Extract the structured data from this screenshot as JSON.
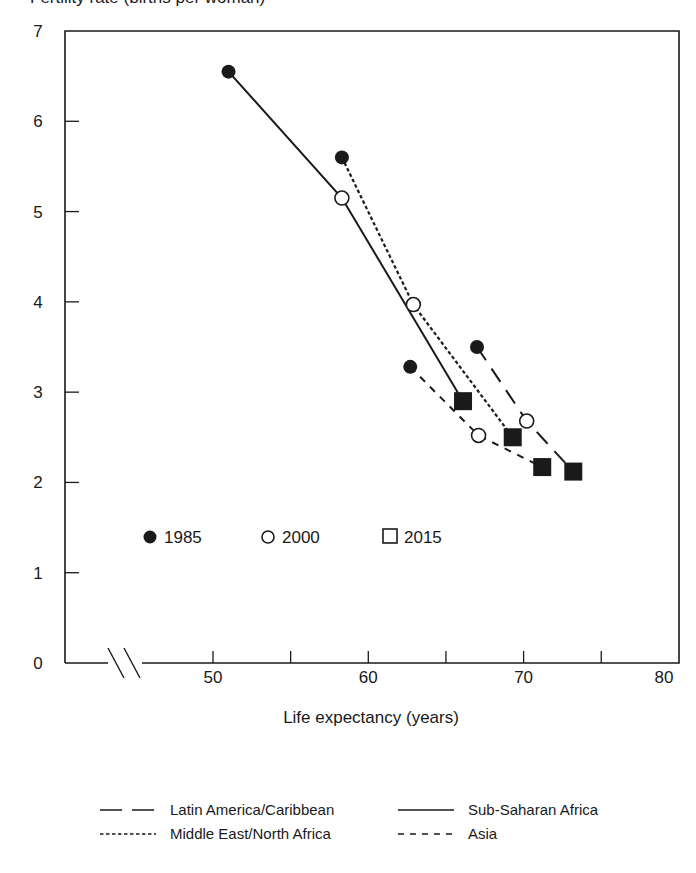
{
  "title_cutoff": "Fertility rate (births per woman)",
  "chart_data": {
    "type": "line",
    "title": "",
    "xlabel": "Life expectancy (years)",
    "ylabel": "",
    "xlim": [
      42,
      80
    ],
    "ylim": [
      0,
      7
    ],
    "x_ticks": [
      50,
      55,
      60,
      65,
      70,
      75,
      80
    ],
    "x_tick_labels": [
      "50",
      "60",
      "70",
      "80"
    ],
    "x_labeled_ticks": [
      50,
      60,
      70,
      80
    ],
    "y_ticks": [
      0,
      1,
      2,
      3,
      4,
      5,
      6,
      7
    ],
    "y_tick_labels": [
      "0",
      "1",
      "2",
      "3",
      "4",
      "5",
      "6",
      "7"
    ],
    "axis_break": true,
    "grid": false,
    "years": [
      "1985",
      "2000",
      "2015"
    ],
    "marker_legend": [
      {
        "label": "1985",
        "marker": "filled-circle"
      },
      {
        "label": "2000",
        "marker": "open-circle"
      },
      {
        "label": "2015",
        "marker": "square"
      }
    ],
    "series": [
      {
        "name": "Sub-Saharan Africa",
        "line_style": "solid",
        "points": [
          {
            "year": "1985",
            "x": 51.0,
            "y": 6.55
          },
          {
            "year": "2000",
            "x": 58.3,
            "y": 5.15
          },
          {
            "year": "2015",
            "x": 66.1,
            "y": 2.9
          }
        ]
      },
      {
        "name": "Middle East/North Africa",
        "line_style": "dotted",
        "points": [
          {
            "year": "1985",
            "x": 58.3,
            "y": 5.6
          },
          {
            "year": "2000",
            "x": 62.9,
            "y": 3.97
          },
          {
            "year": "2015",
            "x": 69.3,
            "y": 2.5
          }
        ]
      },
      {
        "name": "Latin America/Caribbean",
        "line_style": "long-dash",
        "points": [
          {
            "year": "1985",
            "x": 67.0,
            "y": 3.5
          },
          {
            "year": "2000",
            "x": 70.2,
            "y": 2.68
          },
          {
            "year": "2015",
            "x": 73.2,
            "y": 2.12
          }
        ]
      },
      {
        "name": "Asia",
        "line_style": "short-dash",
        "points": [
          {
            "year": "1985",
            "x": 62.7,
            "y": 3.28
          },
          {
            "year": "2000",
            "x": 67.1,
            "y": 2.52
          },
          {
            "year": "2015",
            "x": 71.2,
            "y": 2.17
          }
        ]
      }
    ],
    "line_legend": [
      {
        "label": "Latin America/Caribbean",
        "line_style": "long-dash"
      },
      {
        "label": "Sub-Saharan Africa",
        "line_style": "solid"
      },
      {
        "label": "Middle East/North Africa",
        "line_style": "dotted"
      },
      {
        "label": "Asia",
        "line_style": "short-dash"
      }
    ],
    "legend_position": "marker legend inside plot lower-left; line legend below x-axis"
  },
  "colors": {
    "ink": "#1a1a1a",
    "background": "#ffffff"
  }
}
